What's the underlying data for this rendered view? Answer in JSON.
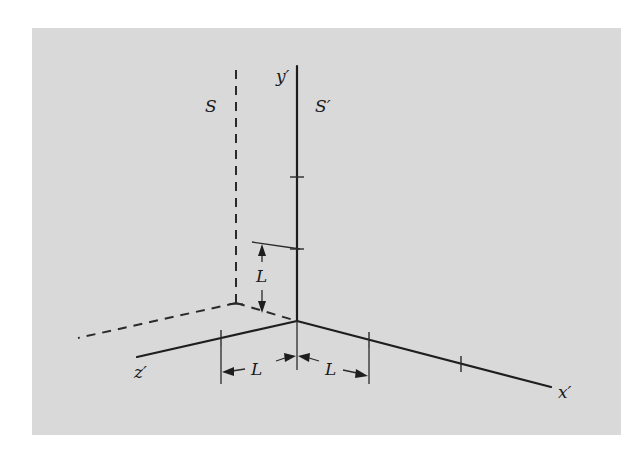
{
  "figure": {
    "type": "reference-frames-diagram",
    "background_color": "#d9d9d9",
    "frames": [
      {
        "name": "S",
        "label": "S",
        "style": "dashed"
      },
      {
        "name": "S_prime",
        "label": "S′",
        "style": "solid"
      }
    ],
    "axes": {
      "y_prime": "y′",
      "x_prime": "x′",
      "z_prime": "z′"
    },
    "dimensions": {
      "vertical_offset_label": "L",
      "z_spacing_label": "L",
      "x_spacing_label": "L"
    }
  }
}
